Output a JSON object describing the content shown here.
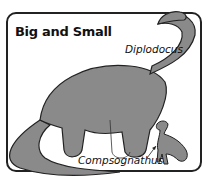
{
  "title": "Big and Small",
  "labels": {
    "large": "Diplodocus",
    "small": "Compsognathus"
  },
  "colors": {
    "body": "#8a8a8a",
    "outline": "#222222",
    "background": "#ffffff"
  }
}
